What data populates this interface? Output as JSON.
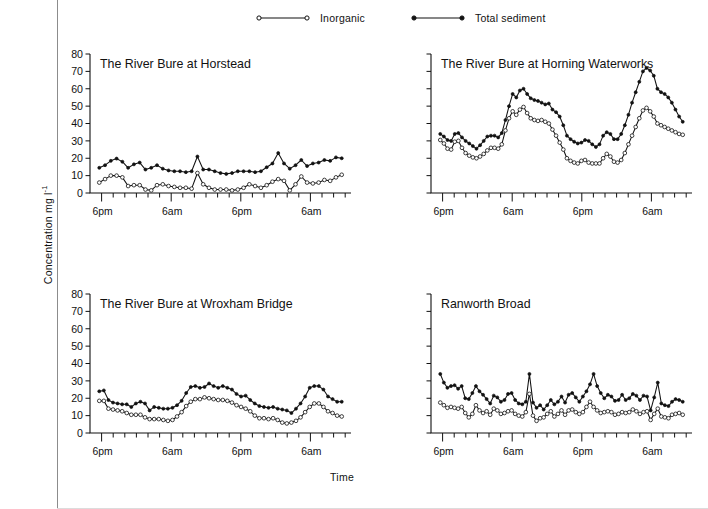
{
  "figure": {
    "ylabel": "Concentration mg l",
    "ylabel_sup": "-1",
    "xlabel": "Time",
    "ink_color": "#111111",
    "background": "#ffffff"
  },
  "legend": {
    "position": "top-center",
    "items": [
      {
        "label": "Inorganic",
        "marker": "open-circle",
        "color": "#111111"
      },
      {
        "label": "Total sediment",
        "marker": "filled-circle",
        "color": "#111111"
      }
    ]
  },
  "chart_data": [
    {
      "type": "line",
      "panel": 1,
      "title": "The River Bure at Horstead",
      "xlabel": "",
      "ylabel": "Concentration mg l-1",
      "ylim": [
        0,
        80
      ],
      "yticks": [
        0,
        10,
        20,
        30,
        40,
        50,
        60,
        70,
        80
      ],
      "ytick_labels": [
        "0",
        "10",
        "20",
        "30",
        "40",
        "50",
        "60",
        "70",
        "80"
      ],
      "show_ytick_labels": true,
      "grid": false,
      "xlim": [
        0,
        45
      ],
      "xtick_labels": [
        "6pm",
        "6am",
        "6pm",
        "6am"
      ],
      "xtick_positions": [
        2,
        14,
        26,
        38
      ],
      "minor_tick_step": 2,
      "x": [
        1,
        2,
        3,
        4,
        5,
        6,
        7,
        8,
        9,
        10,
        11,
        12,
        13,
        14,
        15,
        16,
        17,
        18,
        19,
        20,
        21,
        22,
        23,
        24,
        25,
        26,
        27,
        28,
        29,
        30,
        31,
        32,
        33,
        34,
        35,
        36,
        37,
        38,
        39,
        40,
        41,
        42,
        43
      ],
      "series": [
        {
          "name": "Total sediment",
          "marker": "filled-circle",
          "values": [
            14.5,
            16.0,
            18.5,
            19.8,
            18.0,
            14.5,
            16.5,
            17.5,
            13.5,
            14.5,
            16.0,
            14.0,
            13.0,
            12.5,
            12.5,
            12.0,
            12.5,
            21.0,
            13.5,
            13.5,
            12.5,
            11.5,
            11.0,
            11.5,
            12.5,
            12.5,
            12.5,
            12.0,
            12.5,
            14.8,
            17.0,
            23.0,
            17.0,
            14.0,
            16.0,
            19.0,
            15.5,
            17.0,
            17.5,
            19.0,
            18.5,
            20.5,
            20.0
          ]
        },
        {
          "name": "Inorganic",
          "marker": "open-circle",
          "values": [
            6.0,
            8.0,
            10.0,
            10.0,
            9.0,
            4.0,
            4.5,
            4.5,
            2.0,
            1.5,
            4.5,
            5.0,
            4.0,
            3.5,
            3.0,
            3.0,
            2.5,
            11.5,
            5.0,
            3.0,
            2.0,
            2.0,
            2.0,
            1.5,
            2.0,
            3.0,
            5.0,
            4.0,
            3.0,
            4.5,
            6.5,
            8.0,
            7.0,
            1.5,
            5.0,
            9.5,
            6.0,
            5.5,
            6.0,
            7.5,
            7.0,
            9.0,
            10.5
          ]
        }
      ]
    },
    {
      "type": "line",
      "panel": 2,
      "title": "The River Bure at Horning Waterworks",
      "xlabel": "",
      "ylabel": "Concentration mg l-1",
      "ylim": [
        0,
        80
      ],
      "yticks": [
        0,
        10,
        20,
        30,
        40,
        50,
        60,
        70,
        80
      ],
      "ytick_labels": [],
      "show_ytick_labels": false,
      "grid": false,
      "xlim": [
        0,
        45
      ],
      "xtick_labels": [
        "6pm",
        "6am",
        "6pm",
        "6am"
      ],
      "xtick_positions": [
        2,
        14,
        26,
        38
      ],
      "minor_tick_step": 2,
      "x": [
        1,
        2,
        3,
        4,
        5,
        6,
        7,
        8,
        9,
        10,
        11,
        12,
        13,
        14,
        15,
        16,
        17,
        18,
        19,
        20,
        21,
        22,
        23,
        24,
        25,
        26,
        27,
        28,
        29,
        30,
        31,
        32,
        33,
        34,
        35,
        36,
        37,
        38,
        39,
        40,
        41,
        42,
        43,
        44,
        45,
        46,
        47,
        48,
        49,
        50,
        51,
        52,
        53,
        54,
        55,
        56,
        57,
        58,
        59,
        60,
        61,
        62,
        63,
        64,
        65,
        66,
        67,
        68
      ],
      "series": [
        {
          "name": "Total sediment",
          "marker": "filled-circle",
          "values": [
            34.0,
            32.5,
            30.5,
            30.0,
            34.0,
            34.5,
            32.0,
            30.0,
            28.5,
            27.0,
            25.5,
            27.5,
            30.0,
            32.5,
            33.0,
            33.0,
            32.0,
            34.5,
            42.0,
            50.0,
            57.0,
            55.0,
            59.0,
            60.0,
            57.0,
            54.5,
            53.5,
            53.0,
            52.0,
            51.0,
            51.5,
            48.0,
            46.5,
            44.0,
            39.0,
            33.0,
            31.0,
            29.5,
            28.5,
            29.0,
            30.5,
            30.0,
            28.0,
            26.5,
            28.0,
            33.0,
            35.0,
            34.0,
            31.0,
            31.0,
            34.0,
            39.0,
            45.0,
            52.0,
            58.0,
            64.0,
            70.0,
            72.0,
            70.5,
            67.5,
            60.0,
            58.0,
            57.0,
            55.0,
            52.0,
            48.0,
            44.0,
            41.0
          ]
        },
        {
          "name": "Inorganic",
          "marker": "open-circle",
          "values": [
            30.5,
            28.5,
            25.5,
            25.0,
            29.5,
            30.0,
            26.0,
            23.0,
            21.5,
            20.5,
            20.0,
            21.0,
            22.5,
            24.5,
            26.0,
            26.0,
            25.5,
            28.0,
            36.0,
            43.0,
            47.0,
            45.0,
            48.0,
            49.5,
            46.0,
            43.0,
            42.0,
            41.5,
            42.0,
            41.0,
            40.0,
            36.5,
            33.0,
            29.0,
            25.0,
            20.0,
            18.5,
            17.5,
            17.0,
            18.5,
            19.0,
            17.5,
            17.0,
            17.0,
            17.0,
            20.0,
            22.5,
            21.0,
            18.0,
            17.5,
            19.0,
            23.0,
            28.0,
            33.0,
            38.0,
            43.0,
            47.5,
            49.0,
            47.0,
            44.0,
            40.0,
            39.0,
            38.0,
            37.0,
            36.0,
            35.0,
            34.0,
            33.5
          ]
        }
      ]
    },
    {
      "type": "line",
      "panel": 3,
      "title": "The River Bure at Wroxham Bridge",
      "xlabel": "",
      "ylabel": "Concentration mg l-1",
      "ylim": [
        0,
        80
      ],
      "yticks": [
        0,
        10,
        20,
        30,
        40,
        50,
        60,
        70,
        80
      ],
      "ytick_labels": [
        "0",
        "10",
        "20",
        "30",
        "40",
        "50",
        "60",
        "70",
        "80"
      ],
      "show_ytick_labels": true,
      "grid": false,
      "xlim": [
        0,
        45
      ],
      "xtick_labels": [
        "6pm",
        "6am",
        "6pm",
        "6am"
      ],
      "xtick_positions": [
        2,
        14,
        26,
        38
      ],
      "minor_tick_step": 2,
      "x": [
        1,
        2,
        3,
        4,
        5,
        6,
        7,
        8,
        9,
        10,
        11,
        12,
        13,
        14,
        15,
        16,
        17,
        18,
        19,
        20,
        21,
        22,
        23,
        24,
        25,
        26,
        27,
        28,
        29,
        30,
        31,
        32,
        33,
        34,
        35,
        36,
        37,
        38,
        39,
        40,
        41,
        42,
        43,
        44,
        45,
        46,
        47,
        48,
        49,
        50,
        51,
        52,
        53,
        54,
        55,
        56,
        57,
        58,
        59,
        60,
        61,
        62,
        63,
        64,
        65,
        66
      ],
      "series": [
        {
          "name": "Total sediment",
          "marker": "filled-circle",
          "values": [
            24.0,
            24.5,
            19.0,
            17.5,
            17.0,
            16.5,
            16.5,
            15.0,
            17.0,
            18.0,
            17.0,
            13.0,
            15.0,
            14.5,
            14.0,
            14.0,
            14.5,
            16.0,
            18.5,
            23.0,
            26.5,
            27.0,
            26.0,
            26.5,
            28.5,
            27.0,
            26.0,
            27.0,
            26.0,
            25.0,
            22.5,
            21.0,
            21.5,
            19.0,
            17.0,
            15.5,
            15.0,
            14.5,
            15.0,
            14.0,
            13.5,
            13.0,
            11.5,
            14.0,
            17.0,
            21.0,
            26.0,
            27.0,
            27.0,
            25.0,
            21.0,
            19.5,
            18.0,
            18.0
          ]
        },
        {
          "name": "Inorganic",
          "marker": "open-circle",
          "values": [
            18.5,
            18.5,
            14.0,
            13.5,
            13.0,
            12.5,
            11.5,
            10.5,
            10.5,
            10.5,
            9.0,
            8.0,
            8.0,
            8.0,
            7.5,
            7.0,
            7.5,
            9.5,
            12.0,
            15.5,
            18.0,
            19.5,
            19.5,
            20.5,
            20.0,
            19.5,
            19.0,
            19.0,
            18.5,
            17.5,
            16.0,
            15.0,
            14.0,
            12.5,
            10.0,
            8.5,
            8.5,
            8.0,
            8.5,
            7.5,
            6.0,
            5.5,
            6.0,
            7.0,
            9.0,
            12.0,
            15.0,
            17.0,
            17.0,
            15.0,
            12.5,
            11.5,
            10.0,
            9.5
          ]
        }
      ]
    },
    {
      "type": "line",
      "panel": 4,
      "title": "Ranworth Broad",
      "xlabel": "",
      "ylabel": "Concentration mg l-1",
      "ylim": [
        0,
        80
      ],
      "yticks": [
        0,
        10,
        20,
        30,
        40,
        50,
        60,
        70,
        80
      ],
      "ytick_labels": [],
      "show_ytick_labels": false,
      "grid": false,
      "xlim": [
        0,
        45
      ],
      "xtick_labels": [
        "6pm",
        "6am",
        "6pm",
        "6am"
      ],
      "xtick_positions": [
        2,
        14,
        26,
        38
      ],
      "minor_tick_step": 2,
      "x": [
        1,
        2,
        3,
        4,
        5,
        6,
        7,
        8,
        9,
        10,
        11,
        12,
        13,
        14,
        15,
        16,
        17,
        18,
        19,
        20,
        21,
        22,
        23,
        24,
        25,
        26,
        27,
        28,
        29,
        30,
        31,
        32,
        33,
        34,
        35,
        36,
        37,
        38,
        39,
        40,
        41,
        42,
        43,
        44,
        45,
        46,
        47,
        48,
        49,
        50,
        51,
        52,
        53,
        54,
        55,
        56,
        57,
        58,
        59,
        60,
        61,
        62,
        63,
        64,
        65,
        66,
        67,
        68,
        69,
        70,
        71,
        72,
        73,
        74,
        75,
        76,
        77,
        78,
        79,
        80,
        81,
        82,
        83,
        84,
        85,
        86,
        87,
        88
      ],
      "series": [
        {
          "name": "Total sediment",
          "marker": "filled-circle",
          "values": [
            34.0,
            29.0,
            26.0,
            27.0,
            27.5,
            25.5,
            27.0,
            20.0,
            19.5,
            23.0,
            27.0,
            24.0,
            22.0,
            19.5,
            17.0,
            21.5,
            20.5,
            18.0,
            19.0,
            22.5,
            23.0,
            19.0,
            17.0,
            16.5,
            18.0,
            34.0,
            17.5,
            14.5,
            16.0,
            13.5,
            16.0,
            19.0,
            16.5,
            18.0,
            21.0,
            17.5,
            22.0,
            23.0,
            20.5,
            18.0,
            21.0,
            24.0,
            28.0,
            34.0,
            27.0,
            23.0,
            20.0,
            22.0,
            21.0,
            18.5,
            19.0,
            22.0,
            19.0,
            20.0,
            22.5,
            21.5,
            19.0,
            21.5,
            21.0,
            13.0,
            20.5,
            29.0,
            17.0,
            16.0,
            15.5,
            18.0,
            19.5,
            19.0,
            18.0
          ]
        },
        {
          "name": "Inorganic",
          "marker": "open-circle",
          "values": [
            17.5,
            16.0,
            14.5,
            15.0,
            14.5,
            14.0,
            15.0,
            11.5,
            9.0,
            11.0,
            16.0,
            13.0,
            11.5,
            12.5,
            10.5,
            14.0,
            13.0,
            11.0,
            11.5,
            12.5,
            13.0,
            11.0,
            10.0,
            9.5,
            12.0,
            22.5,
            10.0,
            7.0,
            8.5,
            9.0,
            11.0,
            12.5,
            9.5,
            11.0,
            13.0,
            10.5,
            13.0,
            13.5,
            12.0,
            11.0,
            12.0,
            15.0,
            18.0,
            15.0,
            13.0,
            11.5,
            12.0,
            12.5,
            12.0,
            10.5,
            11.0,
            12.0,
            11.5,
            12.0,
            13.5,
            12.5,
            11.0,
            12.0,
            12.5,
            7.5,
            11.0,
            14.0,
            9.5,
            9.0,
            8.5,
            10.5,
            11.0,
            11.5,
            10.5
          ]
        }
      ]
    }
  ]
}
